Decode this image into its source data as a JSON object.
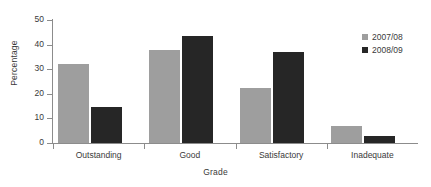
{
  "chart_data": {
    "type": "bar",
    "title": "",
    "subtitle": "",
    "xlabel": "Grade",
    "ylabel": "Percentage",
    "categories": [
      "Outstanding",
      "Good",
      "Satisfactory",
      "Inadequate"
    ],
    "series": [
      {
        "name": "2007/08",
        "color": "#9e9e9e",
        "values": [
          32,
          38,
          22.5,
          7
        ]
      },
      {
        "name": "2008/09",
        "color": "#262626",
        "values": [
          14.5,
          43.5,
          37,
          3
        ]
      }
    ],
    "ylim": [
      0,
      50
    ],
    "yticks": [
      0,
      10,
      20,
      30,
      40,
      50
    ],
    "ytick_labels": [
      "0",
      "10",
      "20",
      "30",
      "40",
      "50"
    ],
    "grid": false,
    "legend_position": "top-right",
    "bar_orientation": "vertical",
    "background_color": "#ffffff",
    "axis_color": "#8c8c8c"
  },
  "legend": {
    "items": [
      {
        "label": "2007/08",
        "swatch": "legend-swatch-2007-08"
      },
      {
        "label": "2008/09",
        "swatch": "legend-swatch-2008-09"
      }
    ]
  }
}
